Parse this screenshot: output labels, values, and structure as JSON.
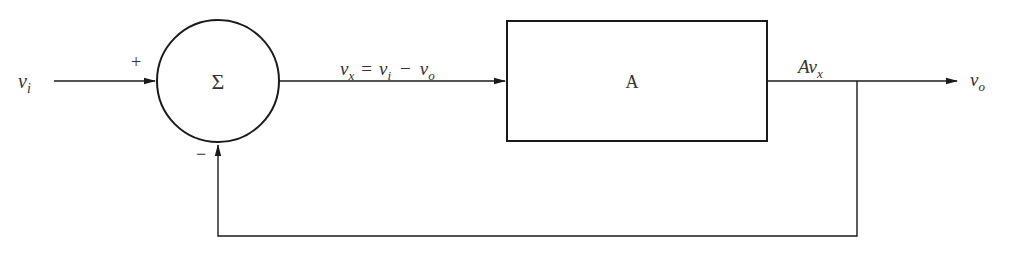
{
  "diagram": {
    "colors": {
      "stroke": "#1a1a1a",
      "text": "#333333",
      "background": "#ffffff"
    },
    "input": {
      "symbol": "v",
      "subscript": "i",
      "sign": "+"
    },
    "summer": {
      "symbol": "Σ",
      "feedback_sign": "−"
    },
    "error_signal": {
      "lhs": {
        "symbol": "v",
        "subscript": "x"
      },
      "equals": "=",
      "rhs1": {
        "symbol": "v",
        "subscript": "i"
      },
      "minus": "−",
      "rhs2": {
        "symbol": "v",
        "subscript": "o"
      }
    },
    "gain_block": {
      "label": "A"
    },
    "amplified_signal": {
      "prefix": "A",
      "symbol": "v",
      "subscript": "x"
    },
    "output": {
      "symbol": "v",
      "subscript": "o"
    }
  }
}
